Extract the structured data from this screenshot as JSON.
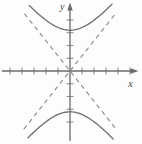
{
  "figure": {
    "background_color": "#fdfdfd",
    "curve_color": "#757575",
    "asymptote_color": "#8b8b8b",
    "axis_color": "#6a6a6a",
    "tick_color": "#8f8f8f",
    "label_color": "#444444"
  },
  "chart_data": {
    "type": "line",
    "title": "",
    "xlabel": "x",
    "ylabel": "y",
    "grid": false,
    "legend": false,
    "axis_numeric_labels_shown": false,
    "xlim": [
      -5.8,
      6.0
    ],
    "ylim": [
      -5.7,
      5.4
    ],
    "x_tick_units": [
      -5,
      -4,
      -3,
      -2,
      -1,
      1,
      2,
      3,
      4,
      5
    ],
    "y_tick_units": [
      -4,
      -3,
      -2,
      -1,
      1,
      2,
      3,
      4
    ],
    "hyperbola": {
      "equation": "y^2/a^2 - x^2/b^2 = 1",
      "a": 3.2,
      "b": 2.7,
      "center": [
        0,
        0
      ],
      "vertices": [
        [
          0,
          3.2
        ],
        [
          0,
          -3.2
        ]
      ],
      "opens": "up-down"
    },
    "series": [
      {
        "name": "hyperbola-upper-branch",
        "style": "solid",
        "branch": "upper",
        "x_range": [
          -3.4,
          3.5
        ]
      },
      {
        "name": "hyperbola-lower-branch",
        "style": "solid",
        "branch": "lower",
        "x_range": [
          -3.5,
          3.6
        ]
      },
      {
        "name": "asymptote-rising",
        "style": "dashed",
        "equation": "y = (a/b)x",
        "slope_sign": 1,
        "x_range": [
          -3.85,
          3.8
        ]
      },
      {
        "name": "asymptote-falling",
        "style": "dashed",
        "equation": "y = -(a/b)x",
        "slope_sign": -1,
        "x_range": [
          -3.8,
          3.85
        ]
      }
    ]
  }
}
